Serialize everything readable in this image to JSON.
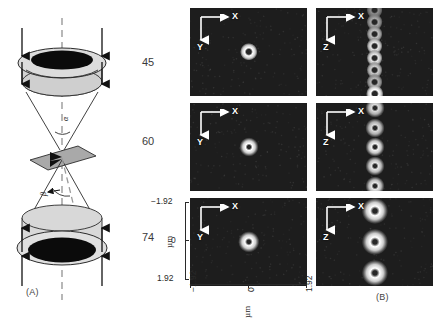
{
  "figure": {
    "panel_a": {
      "tag": "(A)",
      "angle_alpha": "α",
      "angle_beta": "β",
      "aperture_labels": [
        "45",
        "60",
        "74"
      ],
      "description": "Two opposing objective lenses schematic with common focal plane"
    },
    "panel_b": {
      "tag": "(B)",
      "axis_unit": "µm",
      "x_ticks": [
        "−1.92",
        "0",
        "1.92"
      ],
      "y_ticks": [
        "−1.92",
        "0",
        "1.92"
      ],
      "column_axis_labels": [
        {
          "horizontal": "X",
          "vertical": "Y"
        },
        {
          "horizontal": "X",
          "vertical": "Z"
        }
      ],
      "rows": [
        {
          "aperture": "45",
          "xy_spots": 1,
          "xz_spots": 8
        },
        {
          "aperture": "60",
          "xy_spots": 1,
          "xz_spots": 5
        },
        {
          "aperture": "74",
          "xy_spots": 1,
          "xz_spots": 3
        }
      ]
    }
  },
  "chart_data": {
    "type": "heatmap",
    "title": "",
    "xlabel": "µm",
    "ylabel": "µm",
    "xlim": [
      -1.92,
      1.92
    ],
    "ylim": [
      -1.92,
      1.92
    ],
    "grid": false,
    "legend": "none",
    "panels": [
      {
        "row": 0,
        "aperture_deg": 45,
        "section": "XY",
        "horizontal_axis": "X",
        "vertical_axis": "Y",
        "spots": [
          {
            "x": 0.0,
            "y": 0.0,
            "radius_um": 0.22,
            "peak": 1.0
          }
        ]
      },
      {
        "row": 0,
        "aperture_deg": 45,
        "section": "XZ",
        "horizontal_axis": "X",
        "vertical_axis": "Z",
        "spots": [
          {
            "x": 0.0,
            "y": -1.82,
            "radius_um": 0.2,
            "peak": 0.55
          },
          {
            "x": 0.0,
            "y": -1.3,
            "radius_um": 0.2,
            "peak": 0.65
          },
          {
            "x": 0.0,
            "y": -0.78,
            "radius_um": 0.2,
            "peak": 0.75
          },
          {
            "x": 0.0,
            "y": -0.26,
            "radius_um": 0.2,
            "peak": 0.9
          },
          {
            "x": 0.0,
            "y": 0.26,
            "radius_um": 0.2,
            "peak": 0.9
          },
          {
            "x": 0.0,
            "y": 0.78,
            "radius_um": 0.2,
            "peak": 0.8
          },
          {
            "x": 0.0,
            "y": 1.3,
            "radius_um": 0.2,
            "peak": 0.7
          },
          {
            "x": 0.0,
            "y": 1.82,
            "radius_um": 0.22,
            "peak": 1.0
          }
        ]
      },
      {
        "row": 1,
        "aperture_deg": 60,
        "section": "XY",
        "horizontal_axis": "X",
        "vertical_axis": "Y",
        "spots": [
          {
            "x": 0.0,
            "y": 0.0,
            "radius_um": 0.24,
            "peak": 1.0
          }
        ]
      },
      {
        "row": 1,
        "aperture_deg": 60,
        "section": "XZ",
        "horizontal_axis": "X",
        "vertical_axis": "Z",
        "spots": [
          {
            "x": 0.0,
            "y": -1.7,
            "radius_um": 0.24,
            "peak": 0.85
          },
          {
            "x": 0.0,
            "y": -0.85,
            "radius_um": 0.24,
            "peak": 0.85
          },
          {
            "x": 0.0,
            "y": 0.0,
            "radius_um": 0.24,
            "peak": 0.95
          },
          {
            "x": 0.0,
            "y": 0.85,
            "radius_um": 0.24,
            "peak": 0.9
          },
          {
            "x": 0.0,
            "y": 1.7,
            "radius_um": 0.24,
            "peak": 0.9
          }
        ]
      },
      {
        "row": 2,
        "aperture_deg": 74,
        "section": "XY",
        "horizontal_axis": "X",
        "vertical_axis": "Y",
        "spots": [
          {
            "x": 0.0,
            "y": 0.0,
            "radius_um": 0.27,
            "peak": 1.0
          }
        ]
      },
      {
        "row": 2,
        "aperture_deg": 74,
        "section": "XZ",
        "horizontal_axis": "X",
        "vertical_axis": "Z",
        "spots": [
          {
            "x": 0.0,
            "y": -1.35,
            "radius_um": 0.33,
            "peak": 1.0
          },
          {
            "x": 0.0,
            "y": 0.0,
            "radius_um": 0.33,
            "peak": 1.0
          },
          {
            "x": 0.0,
            "y": 1.35,
            "radius_um": 0.33,
            "peak": 1.0
          }
        ]
      }
    ]
  },
  "colors": {
    "background": "#ffffff",
    "image_background": "#1d1d1d",
    "spot_core": "#ffffff",
    "spot_halo": "#b9b9b9",
    "lens_fill": "#c9c9c9",
    "lens_fill_light": "#d8d8d8",
    "aperture_black": "#0b0b0b",
    "line": "#1b1b1b"
  }
}
